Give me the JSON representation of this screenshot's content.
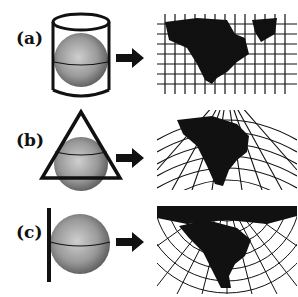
{
  "figure": {
    "rows": [
      {
        "label": "(a)",
        "surface": "cylinder",
        "projection": "cylindrical"
      },
      {
        "label": "(b)",
        "surface": "cone",
        "projection": "conic"
      },
      {
        "label": "(c)",
        "surface": "plane",
        "projection": "planar"
      }
    ],
    "colors": {
      "ink": "#111111",
      "globe_light": "#c8c8c8",
      "globe_dark": "#555555",
      "background": "#ffffff"
    }
  }
}
